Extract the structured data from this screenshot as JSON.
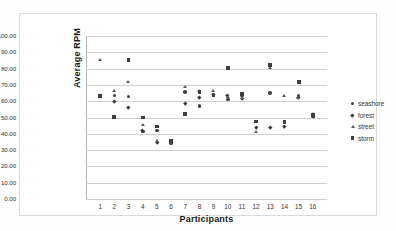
{
  "chart_data": {
    "type": "scatter",
    "title": "",
    "xlabel": "Participants",
    "ylabel": "Average RPM",
    "xlim": [
      0,
      17
    ],
    "ylim": [
      0,
      100
    ],
    "ytick_labels": [
      "100.00",
      "90.00",
      "80.00",
      "70.00",
      "60.00",
      "50.00",
      "40.00",
      "30.00",
      "20.00",
      "10.00",
      "0.00"
    ],
    "ytick_values": [
      100,
      90,
      80,
      70,
      60,
      50,
      40,
      30,
      20,
      10,
      0
    ],
    "ytick_step": 10,
    "categories": [
      "1",
      "2",
      "3",
      "4",
      "5",
      "6",
      "7",
      "8",
      "9",
      "10",
      "11",
      "12",
      "13",
      "14",
      "15",
      "16"
    ],
    "x": [
      1,
      2,
      3,
      4,
      5,
      6,
      7,
      8,
      9,
      10,
      11,
      12,
      13,
      14,
      15,
      16
    ],
    "grid": "horizontal",
    "legend_position": "right",
    "series": [
      {
        "name": "seashore",
        "marker": "circle",
        "color": "#404040",
        "values": [
          63.0,
          63.5,
          63.0,
          41.5,
          42.0,
          34.5,
          65.5,
          57.0,
          64.0,
          61.0,
          63.5,
          47.5,
          65.0,
          47.0,
          63.5,
          50.5
        ]
      },
      {
        "name": "forest",
        "marker": "diamond",
        "color": "#3a3a3a",
        "values": [
          63.5,
          60.0,
          56.5,
          42.0,
          35.0,
          35.0,
          58.5,
          62.5,
          64.5,
          63.5,
          62.0,
          44.0,
          44.0,
          44.5,
          62.5,
          51.0
        ]
      },
      {
        "name": "street",
        "marker": "triangle",
        "color": "#5a5a5a",
        "values": [
          85.5,
          66.0,
          72.0,
          45.5,
          35.5,
          34.0,
          69.0,
          66.5,
          66.0,
          62.5,
          62.0,
          41.0,
          80.5,
          63.0,
          62.0,
          52.0
        ]
      },
      {
        "name": "storm",
        "marker": "square",
        "color": "#3d3d3d",
        "values": [
          63.0,
          50.5,
          85.5,
          50.0,
          44.5,
          35.5,
          52.0,
          65.5,
          63.5,
          80.5,
          64.5,
          47.5,
          82.0,
          47.0,
          72.0,
          51.5
        ]
      }
    ]
  },
  "legend": {
    "items": [
      {
        "label": "seashore",
        "icon": "circle-marker-icon"
      },
      {
        "label": "forest",
        "icon": "diamond-marker-icon"
      },
      {
        "label": "street",
        "icon": "triangle-marker-icon"
      },
      {
        "label": "storm",
        "icon": "square-marker-icon"
      }
    ]
  }
}
